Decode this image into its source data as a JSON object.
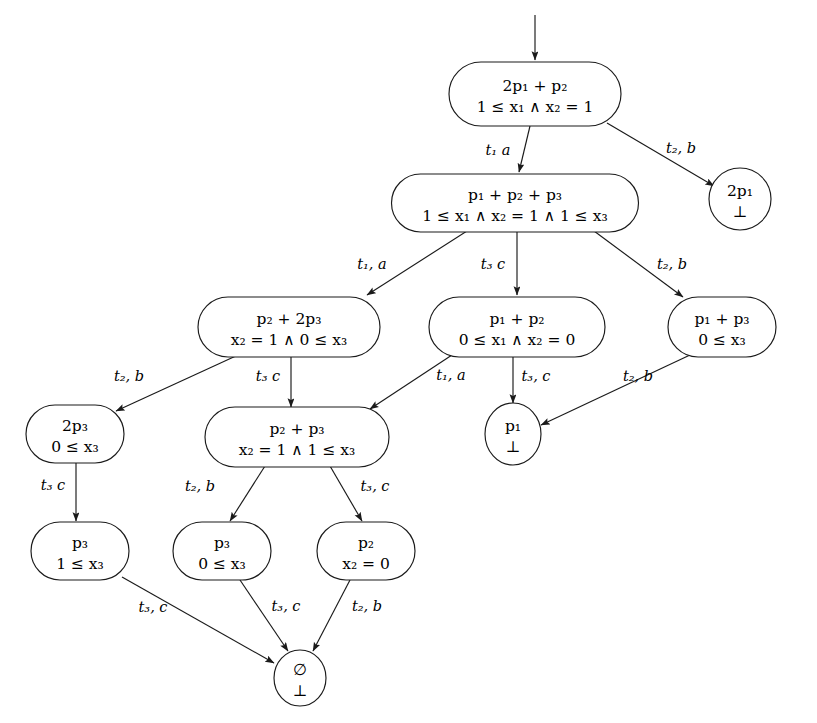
{
  "diagram": {
    "background_color": "#ffffff",
    "stroke_color": "#1a1a1a",
    "text_color": "#000000"
  },
  "nodes": [
    {
      "id": "n0",
      "shape": "rounded-rect",
      "line1": "2p₁ + p₂",
      "line2": "1 ≤ x₁ ∧ x₂ = 1",
      "cx": 535,
      "cy": 94,
      "w": 172,
      "h": 64
    },
    {
      "id": "n1",
      "shape": "rounded-rect",
      "line1": "p₁ + p₂ + p₃",
      "line2": "1 ≤ x₁ ∧ x₂ = 1 ∧ 1 ≤ x₃",
      "cx": 515,
      "cy": 203,
      "w": 247,
      "h": 58
    },
    {
      "id": "n2",
      "shape": "circle",
      "line1": "2p₁",
      "line2": "⊥",
      "cx": 740,
      "cy": 199,
      "w": 62,
      "h": 62
    },
    {
      "id": "n3",
      "shape": "rounded-rect",
      "line1": "p₂ + 2p₃",
      "line2": "x₂ = 1 ∧ 0 ≤ x₃",
      "cx": 289,
      "cy": 327,
      "w": 182,
      "h": 60
    },
    {
      "id": "n4",
      "shape": "rounded-rect",
      "line1": "p₁ + p₂",
      "line2": "0 ≤ x₁ ∧ x₂ = 0",
      "cx": 517,
      "cy": 327,
      "w": 176,
      "h": 60
    },
    {
      "id": "n5",
      "shape": "rounded-rect",
      "line1": "p₁ + p₃",
      "line2": "0 ≤ x₃",
      "cx": 722,
      "cy": 327,
      "w": 108,
      "h": 60
    },
    {
      "id": "n6",
      "shape": "rounded-rect",
      "line1": "2p₃",
      "line2": "0 ≤ x₃",
      "cx": 75,
      "cy": 434,
      "w": 98,
      "h": 58
    },
    {
      "id": "n7",
      "shape": "rounded-rect",
      "line1": "p₂ + p₃",
      "line2": "x₂ = 1 ∧ 1 ≤ x₃",
      "cx": 297,
      "cy": 437,
      "w": 184,
      "h": 60
    },
    {
      "id": "n8",
      "shape": "circle",
      "line1": "p₁",
      "line2": "⊥",
      "cx": 513,
      "cy": 434,
      "w": 56,
      "h": 62
    },
    {
      "id": "n9",
      "shape": "rounded-rect",
      "line1": "p₃",
      "line2": "1 ≤ x₃",
      "cx": 80,
      "cy": 551,
      "w": 98,
      "h": 58
    },
    {
      "id": "n10",
      "shape": "rounded-rect",
      "line1": "p₃",
      "line2": "0 ≤ x₃",
      "cx": 222,
      "cy": 551,
      "w": 98,
      "h": 58
    },
    {
      "id": "n11",
      "shape": "rounded-rect",
      "line1": "p₂",
      "line2": "x₂ = 0",
      "cx": 366,
      "cy": 551,
      "w": 98,
      "h": 58
    },
    {
      "id": "n12",
      "shape": "circle",
      "line1": "∅",
      "line2": "⊥",
      "cx": 300,
      "cy": 678,
      "w": 52,
      "h": 56
    }
  ],
  "edges": [
    {
      "id": "e-init",
      "from": "",
      "to": "n0",
      "label": "",
      "x1": 535,
      "y1": 15,
      "x2": 535,
      "y2": 60
    },
    {
      "id": "e0",
      "from": "n0",
      "to": "n1",
      "label": "t₁  a",
      "x1": 530,
      "y1": 126,
      "x2": 519,
      "y2": 172,
      "lx": 498,
      "ly": 155
    },
    {
      "id": "e1",
      "from": "n0",
      "to": "n2",
      "label": "t₂, b",
      "x1": 607,
      "y1": 123,
      "x2": 714,
      "y2": 186,
      "lx": 681,
      "ly": 153
    },
    {
      "id": "e2",
      "from": "n1",
      "to": "n3",
      "label": "t₁, a",
      "x1": 467,
      "y1": 231,
      "x2": 367,
      "y2": 295,
      "lx": 372,
      "ly": 269
    },
    {
      "id": "e3",
      "from": "n1",
      "to": "n4",
      "label": "t₃  c",
      "x1": 517,
      "y1": 232,
      "x2": 517,
      "y2": 295,
      "lx": 493,
      "ly": 269
    },
    {
      "id": "e4",
      "from": "n1",
      "to": "n5",
      "label": "t₂, b",
      "x1": 594,
      "y1": 231,
      "x2": 683,
      "y2": 297,
      "lx": 672,
      "ly": 269
    },
    {
      "id": "e5",
      "from": "n3",
      "to": "n6",
      "label": "t₂, b",
      "x1": 238,
      "y1": 355,
      "x2": 116,
      "y2": 411,
      "lx": 129,
      "ly": 381
    },
    {
      "id": "e6",
      "from": "n3",
      "to": "n7",
      "label": "t₃  c",
      "x1": 291,
      "y1": 357,
      "x2": 291,
      "y2": 407,
      "lx": 268,
      "ly": 381
    },
    {
      "id": "e7",
      "from": "n4",
      "to": "n7",
      "label": "t₁, a",
      "x1": 452,
      "y1": 355,
      "x2": 370,
      "y2": 409,
      "lx": 451,
      "ly": 380
    },
    {
      "id": "e8",
      "from": "n4",
      "to": "n8",
      "label": "t₃, c",
      "x1": 513,
      "y1": 357,
      "x2": 513,
      "y2": 403,
      "lx": 536,
      "ly": 381
    },
    {
      "id": "e9",
      "from": "n5",
      "to": "n8",
      "label": "t₂, b",
      "x1": 690,
      "y1": 355,
      "x2": 541,
      "y2": 425,
      "lx": 638,
      "ly": 381
    },
    {
      "id": "e10",
      "from": "n6",
      "to": "n9",
      "label": "t₃  c",
      "x1": 76,
      "y1": 463,
      "x2": 76,
      "y2": 521,
      "lx": 53,
      "ly": 490
    },
    {
      "id": "e11",
      "from": "n7",
      "to": "n10",
      "label": "t₂, b",
      "x1": 265,
      "y1": 466,
      "x2": 230,
      "y2": 521,
      "lx": 200,
      "ly": 491
    },
    {
      "id": "e12",
      "from": "n7",
      "to": "n11",
      "label": "t₃, c",
      "x1": 330,
      "y1": 466,
      "x2": 362,
      "y2": 521,
      "lx": 375,
      "ly": 491
    },
    {
      "id": "e13",
      "from": "n9",
      "to": "n12",
      "label": "t₃, c",
      "x1": 122,
      "y1": 577,
      "x2": 274,
      "y2": 663,
      "lx": 153,
      "ly": 612
    },
    {
      "id": "e14",
      "from": "n10",
      "to": "n12",
      "label": "t₃, c",
      "x1": 240,
      "y1": 580,
      "x2": 288,
      "y2": 651,
      "lx": 286,
      "ly": 611
    },
    {
      "id": "e15",
      "from": "n11",
      "to": "n12",
      "label": "t₂, b",
      "x1": 350,
      "y1": 580,
      "x2": 313,
      "y2": 651,
      "lx": 367,
      "ly": 611
    }
  ]
}
